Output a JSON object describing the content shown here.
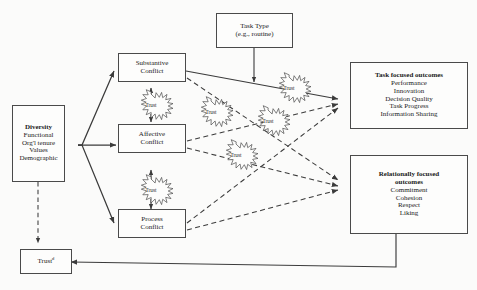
{
  "diagram": {
    "colors": {
      "stroke": "#4a4a4a",
      "text": "#1b1b1b",
      "background": "#fbfbfa",
      "box_fill": "#fdfdfc"
    }
  },
  "boxes": {
    "diversity": {
      "name": "Diversity",
      "header": "Diversity",
      "items": [
        "Functional",
        "Org'l tenure",
        "Values",
        "Demographic"
      ]
    },
    "task_type": {
      "name": "Task Type",
      "line1": "Task Type",
      "line2": "(e.g., routine)"
    },
    "substantive_conflict": {
      "line1": "Substantive",
      "line2": "Conflict"
    },
    "affective_conflict": {
      "line1": "Affective",
      "line2": "Conflict"
    },
    "process_conflict": {
      "line1": "Process",
      "line2": "Conflict"
    },
    "task_outcomes": {
      "header": "Task focused outcomes",
      "items": [
        "Performance",
        "Innovation",
        "Decision Quality",
        "Task Progress",
        "Information Sharing"
      ]
    },
    "relational_outcomes": {
      "header_line1": "Relationally focused",
      "header_line2": "outcomes",
      "items": [
        "Commitment",
        "Cohesion",
        "Respect",
        "Liking"
      ]
    },
    "trust_bottom": {
      "label": "Trust",
      "superscript": "d"
    }
  },
  "starbursts": [
    {
      "id": "trust-sub-aff",
      "label": "Trust",
      "cx": 151,
      "cy": 105
    },
    {
      "id": "trust-aff-proc",
      "label": "Trust",
      "cx": 151,
      "cy": 190
    },
    {
      "id": "trust-mid-left",
      "label": "Trust",
      "cx": 211,
      "cy": 112
    },
    {
      "id": "trust-top-right",
      "label": "Trust",
      "cx": 289,
      "cy": 88
    },
    {
      "id": "trust-mid-right",
      "label": "Trust",
      "cx": 268,
      "cy": 121
    },
    {
      "id": "trust-lower-mid",
      "label": "Trust",
      "cx": 236,
      "cy": 155
    }
  ],
  "edges": {
    "solid": [
      "diversity-to-substantive",
      "diversity-to-affective",
      "diversity-to-process",
      "substantive-to-task-outcomes",
      "task-type-to-center",
      "substantive-affective-bidirectional",
      "affective-process-bidirectional",
      "relational-outcomes-to-trust"
    ],
    "dashed": [
      "substantive-to-relational-outcomes",
      "affective-to-task-outcomes",
      "affective-to-relational-outcomes",
      "process-to-task-outcomes",
      "process-to-relational-outcomes",
      "diversity-to-trust-bottom"
    ]
  }
}
